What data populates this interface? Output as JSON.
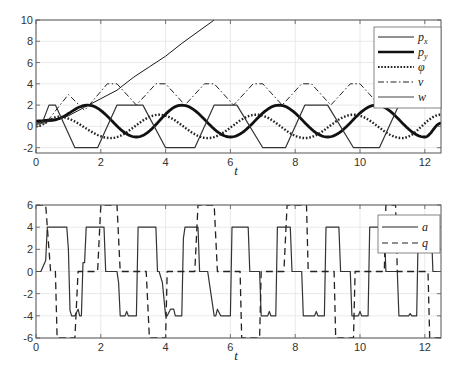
{
  "chart_data": [
    {
      "type": "line",
      "title": "",
      "xlabel": "t",
      "ylabel": "",
      "xlim": [
        0,
        12.5
      ],
      "ylim": [
        -2.5,
        10
      ],
      "grid": true,
      "legend_position": "upper right",
      "x_ticks": [
        "0",
        "2",
        "4",
        "6",
        "8",
        "10",
        "12"
      ],
      "y_ticks": [
        "-2",
        "0",
        "2",
        "4",
        "6",
        "8",
        "10"
      ],
      "series": [
        {
          "name": "p_x",
          "label": "px",
          "style": "solid thin",
          "x": [
            0,
            0.5,
            1,
            1.5,
            2,
            2.5,
            3,
            3.5,
            4,
            4.5,
            5,
            5.5
          ],
          "values": [
            0.3,
            0.5,
            1.0,
            1.8,
            2.6,
            3.4,
            4.6,
            5.6,
            6.6,
            7.8,
            8.9,
            10.0
          ]
        },
        {
          "name": "p_y",
          "label": "py",
          "style": "solid thick",
          "x": [
            0,
            0.5,
            1.6,
            3.1,
            4.5,
            6.0,
            7.5,
            9.0,
            10.5,
            12.0,
            12.5
          ],
          "values": [
            0.5,
            0.6,
            2.0,
            -1.0,
            2.0,
            -1.0,
            2.0,
            -1.0,
            2.0,
            -1.0,
            0.3
          ]
        },
        {
          "name": "phi",
          "label": "φ",
          "style": "dotted",
          "x": [
            0,
            0.7,
            2.3,
            3.8,
            5.3,
            6.8,
            8.3,
            9.8,
            11.3,
            12.5
          ],
          "values": [
            0.0,
            0.9,
            -1.1,
            1.1,
            -1.1,
            1.1,
            -1.1,
            1.1,
            -1.1,
            1.1
          ]
        },
        {
          "name": "v",
          "label": "v",
          "style": "dash-dot",
          "x": [
            0,
            0.3,
            1.0,
            1.5,
            2.2,
            2.5,
            3.1,
            3.7,
            4.0,
            4.6,
            5.2,
            5.5,
            6.1,
            6.7,
            7.0,
            7.6,
            8.2,
            8.5,
            9.1,
            9.7,
            10.0,
            10.6,
            11.2,
            11.5,
            12.1,
            12.5
          ],
          "values": [
            0.2,
            0.3,
            3.0,
            1.5,
            4.0,
            4.0,
            2.0,
            4.0,
            4.0,
            2.0,
            4.0,
            4.0,
            2.0,
            4.0,
            4.0,
            2.0,
            4.0,
            4.0,
            2.0,
            4.0,
            4.0,
            2.0,
            4.0,
            4.0,
            2.0,
            4.0
          ]
        },
        {
          "name": "w",
          "label": "w",
          "style": "solid",
          "x": [
            0,
            0.2,
            0.4,
            0.6,
            1.2,
            1.9,
            2.5,
            3.3,
            4.0,
            4.9,
            5.5,
            6.2,
            7.0,
            7.7,
            8.3,
            9.0,
            9.8,
            10.6,
            11.2,
            11.9,
            12.5
          ],
          "values": [
            0.3,
            0.4,
            2.0,
            2.0,
            -2.0,
            -2.0,
            2.0,
            2.0,
            -2.0,
            -2.0,
            2.0,
            2.0,
            -2.0,
            -2.0,
            2.0,
            2.0,
            -2.0,
            -2.0,
            2.0,
            2.0,
            2.0
          ]
        }
      ]
    },
    {
      "type": "line",
      "title": "",
      "xlabel": "t",
      "ylabel": "",
      "xlim": [
        0,
        12.5
      ],
      "ylim": [
        -6,
        6
      ],
      "grid": true,
      "legend_position": "upper right",
      "x_ticks": [
        "0",
        "2",
        "4",
        "6",
        "8",
        "10",
        "12"
      ],
      "y_ticks": [
        "-6",
        "-4",
        "-2",
        "0",
        "2",
        "4",
        "6"
      ],
      "series": [
        {
          "name": "a",
          "label": "a",
          "style": "solid",
          "x": [
            0,
            0.15,
            0.3,
            0.35,
            0.95,
            1.0,
            1.05,
            1.1,
            1.2,
            1.3,
            1.35,
            1.4,
            1.45,
            1.5,
            1.55,
            2.1,
            2.15,
            2.2,
            2.5,
            2.55,
            2.6,
            2.75,
            2.8,
            2.85,
            3.1,
            3.15,
            3.7,
            3.75,
            3.8,
            3.9,
            4.0,
            4.05,
            4.15,
            4.25,
            4.3,
            4.35,
            4.5,
            4.55,
            4.6,
            5.0,
            5.05,
            5.3,
            5.35,
            5.5,
            5.55,
            5.6,
            5.7,
            6.0,
            6.05,
            6.55,
            6.6,
            6.9,
            6.95,
            7.15,
            7.2,
            7.25,
            7.4,
            7.45,
            7.5,
            7.85,
            7.9,
            8.2,
            8.25,
            8.6,
            8.65,
            8.7,
            8.9,
            8.95,
            9.35,
            9.4,
            9.7,
            9.75,
            9.95,
            10.0,
            10.05,
            10.25,
            10.3,
            10.75,
            10.8,
            11.15,
            11.2,
            11.5,
            11.55,
            11.6,
            11.75,
            11.8,
            12.2,
            12.25,
            12.5
          ],
          "values": [
            0,
            0,
            1.0,
            4.0,
            4.0,
            2.0,
            -3.5,
            -4.0,
            -4.0,
            -3.4,
            -4.0,
            -4.0,
            0.8,
            0.8,
            4.0,
            4.0,
            0.0,
            0.0,
            0.0,
            -1.0,
            -4.0,
            -4.0,
            -3.6,
            -4.0,
            -4.0,
            4.0,
            4.0,
            0.0,
            0.0,
            -1.0,
            -4.0,
            -4.0,
            -3.4,
            -3.4,
            -4.0,
            -4.0,
            -4.0,
            3.0,
            4.0,
            4.0,
            0.0,
            0.0,
            -1.0,
            -4.0,
            -4.0,
            -3.4,
            -4.0,
            -4.0,
            4.0,
            4.0,
            0.0,
            0.0,
            -4.0,
            -4.0,
            -3.6,
            -4.0,
            -4.0,
            4.0,
            4.0,
            4.0,
            0.0,
            0.0,
            -4.0,
            -4.0,
            -3.6,
            -4.0,
            -4.0,
            4.0,
            4.0,
            0.0,
            0.0,
            -4.0,
            -4.0,
            -3.6,
            -4.0,
            -4.0,
            4.0,
            4.0,
            0.0,
            0.0,
            -4.0,
            -4.0,
            -3.8,
            -4.0,
            -4.0,
            4.0,
            4.0,
            0.0,
            0.0
          ]
        },
        {
          "name": "q",
          "label": "q",
          "style": "dashed",
          "x": [
            0,
            0.3,
            0.45,
            0.6,
            0.65,
            1.1,
            1.2,
            1.3,
            1.5,
            1.9,
            2.0,
            2.5,
            2.6,
            3.4,
            3.5,
            4.0,
            4.05,
            4.45,
            4.5,
            4.9,
            5.0,
            5.5,
            5.6,
            6.3,
            6.35,
            6.9,
            6.95,
            7.55,
            7.65,
            7.75,
            7.8,
            8.35,
            8.4,
            9.2,
            9.25,
            9.8,
            9.85,
            10.75,
            10.8,
            11.1,
            11.15,
            11.55,
            11.6,
            12.1,
            12.15,
            12.5
          ],
          "values": [
            6,
            6,
            0.0,
            0.0,
            -6.0,
            -6.0,
            -6.0,
            0.0,
            0.0,
            0.0,
            6.0,
            6.0,
            0.0,
            0.0,
            -6.0,
            -6.0,
            0.0,
            0.0,
            0.0,
            0.0,
            6.0,
            6.0,
            0.0,
            0.0,
            -6.0,
            -6.0,
            0.0,
            0.0,
            0.0,
            6.0,
            6.0,
            6.0,
            0.0,
            0.0,
            -6.0,
            -6.0,
            0.0,
            0.0,
            6.0,
            6.0,
            0.0,
            0.0,
            0.0,
            0.0,
            -6.0,
            -6.0
          ]
        }
      ]
    }
  ],
  "top_plot": {
    "xlabel": "t",
    "x_ticks": [
      "0",
      "2",
      "4",
      "6",
      "8",
      "10",
      "12"
    ],
    "y_ticks": [
      "-2",
      "0",
      "2",
      "4",
      "6",
      "8",
      "10"
    ],
    "legend": [
      "p",
      "p",
      "φ",
      "v",
      "w"
    ],
    "legend_sub": [
      "x",
      "y",
      "",
      "",
      ""
    ]
  },
  "bottom_plot": {
    "xlabel": "t",
    "x_ticks": [
      "0",
      "2",
      "4",
      "6",
      "8",
      "10",
      "12"
    ],
    "y_ticks": [
      "-6",
      "-4",
      "-2",
      "0",
      "2",
      "4",
      "6"
    ],
    "legend": [
      "a",
      "q"
    ]
  },
  "colors": {
    "line": "#1a1a1a",
    "grid": "#e3e3e3",
    "axis": "#555555"
  }
}
